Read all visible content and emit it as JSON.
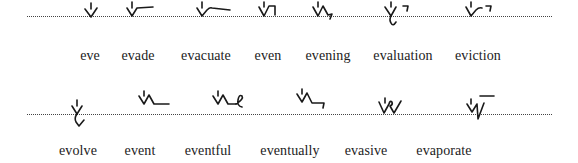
{
  "rows": [
    {
      "entries": [
        {
          "word": "eve"
        },
        {
          "word": "evade"
        },
        {
          "word": "evacuate"
        },
        {
          "word": "even"
        },
        {
          "word": "evening"
        },
        {
          "word": "evaluation"
        },
        {
          "word": "eviction"
        }
      ]
    },
    {
      "entries": [
        {
          "word": "evolve"
        },
        {
          "word": "event"
        },
        {
          "word": "eventful"
        },
        {
          "word": "eventually"
        },
        {
          "word": "evasive"
        },
        {
          "word": "evaporate"
        }
      ]
    }
  ],
  "colors": {
    "ink": "#1a1a1a",
    "text": "#222222",
    "ruled_line": "#444444",
    "background": "#ffffff"
  }
}
